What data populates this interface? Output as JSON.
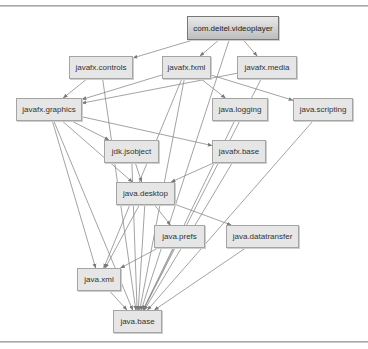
{
  "diagram": {
    "type": "module-dependency-graph",
    "colors": {
      "node_fill": "#e6e6e6",
      "node_border": "#a4a4a4",
      "root_fill_top": "#e9e9e9",
      "root_fill_bottom": "#bdbdbd",
      "edge": "#8c8c8c",
      "text": "#333333"
    },
    "nodes": [
      {
        "id": "root",
        "label": "com.deitel.videoplayer",
        "x": 187,
        "y": 16,
        "w": 92,
        "h": 24,
        "root": true
      },
      {
        "id": "controls",
        "label": "javafx.controls",
        "x": 69,
        "y": 56,
        "w": 64,
        "h": 23
      },
      {
        "id": "fxml",
        "label": "javafx.fxml",
        "x": 162,
        "y": 56,
        "w": 49,
        "h": 23
      },
      {
        "id": "media",
        "label": "javafx.media",
        "x": 237,
        "y": 56,
        "w": 60,
        "h": 23
      },
      {
        "id": "graphics",
        "label": "javafx.graphics",
        "x": 16,
        "y": 98,
        "w": 66,
        "h": 23
      },
      {
        "id": "logging",
        "label": "java.logging",
        "x": 212,
        "y": 98,
        "w": 56,
        "h": 23
      },
      {
        "id": "scripting",
        "label": "java.scripting",
        "x": 293,
        "y": 98,
        "w": 60,
        "h": 23
      },
      {
        "id": "jsobject",
        "label": "jdk.jsobject",
        "x": 104,
        "y": 140,
        "w": 55,
        "h": 23
      },
      {
        "id": "fxbase",
        "label": "javafx.base",
        "x": 212,
        "y": 140,
        "w": 54,
        "h": 23
      },
      {
        "id": "desktop",
        "label": "java.desktop",
        "x": 116,
        "y": 182,
        "w": 59,
        "h": 23
      },
      {
        "id": "prefs",
        "label": "java.prefs",
        "x": 154,
        "y": 225,
        "w": 51,
        "h": 23
      },
      {
        "id": "datatransfer",
        "label": "java.datatransfer",
        "x": 226,
        "y": 225,
        "w": 73,
        "h": 23
      },
      {
        "id": "xml",
        "label": "java.xml",
        "x": 77,
        "y": 268,
        "w": 44,
        "h": 23
      },
      {
        "id": "base",
        "label": "java.base",
        "x": 113,
        "y": 310,
        "w": 49,
        "h": 23
      }
    ],
    "edges": [
      {
        "from": "root",
        "to": "controls"
      },
      {
        "from": "root",
        "to": "fxml"
      },
      {
        "from": "root",
        "to": "media"
      },
      {
        "from": "root",
        "to": "base"
      },
      {
        "from": "controls",
        "to": "graphics"
      },
      {
        "from": "controls",
        "to": "base"
      },
      {
        "from": "fxml",
        "to": "graphics"
      },
      {
        "from": "fxml",
        "to": "logging"
      },
      {
        "from": "fxml",
        "to": "scripting"
      },
      {
        "from": "fxml",
        "to": "xml"
      },
      {
        "from": "fxml",
        "to": "base"
      },
      {
        "from": "media",
        "to": "graphics"
      },
      {
        "from": "media",
        "to": "base"
      },
      {
        "from": "graphics",
        "to": "jsobject"
      },
      {
        "from": "graphics",
        "to": "fxbase"
      },
      {
        "from": "graphics",
        "to": "desktop"
      },
      {
        "from": "graphics",
        "to": "xml"
      },
      {
        "from": "graphics",
        "to": "base"
      },
      {
        "from": "jsobject",
        "to": "desktop"
      },
      {
        "from": "jsobject",
        "to": "base"
      },
      {
        "from": "fxbase",
        "to": "desktop"
      },
      {
        "from": "fxbase",
        "to": "base"
      },
      {
        "from": "logging",
        "to": "base"
      },
      {
        "from": "scripting",
        "to": "base"
      },
      {
        "from": "desktop",
        "to": "prefs"
      },
      {
        "from": "desktop",
        "to": "datatransfer"
      },
      {
        "from": "desktop",
        "to": "xml"
      },
      {
        "from": "desktop",
        "to": "base"
      },
      {
        "from": "prefs",
        "to": "xml"
      },
      {
        "from": "prefs",
        "to": "base"
      },
      {
        "from": "datatransfer",
        "to": "base"
      },
      {
        "from": "xml",
        "to": "base"
      }
    ]
  }
}
